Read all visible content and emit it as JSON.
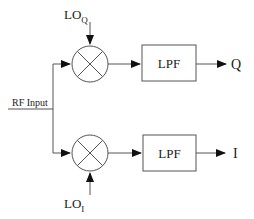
{
  "diagram": {
    "input": {
      "label": "RF Input"
    },
    "mixers": [
      {
        "id": "mixer-q",
        "lo_label": "LO",
        "lo_sub": "Q"
      },
      {
        "id": "mixer-i",
        "lo_label": "LO",
        "lo_sub": "I"
      }
    ],
    "filters": [
      {
        "id": "lpf-q",
        "label": "LPF"
      },
      {
        "id": "lpf-i",
        "label": "LPF"
      }
    ],
    "outputs": [
      {
        "id": "out-q",
        "label": "Q"
      },
      {
        "id": "out-i",
        "label": "I"
      }
    ],
    "colors": {
      "line": "#555555",
      "text": "#1a1a1a",
      "arrow": "#111111"
    }
  }
}
